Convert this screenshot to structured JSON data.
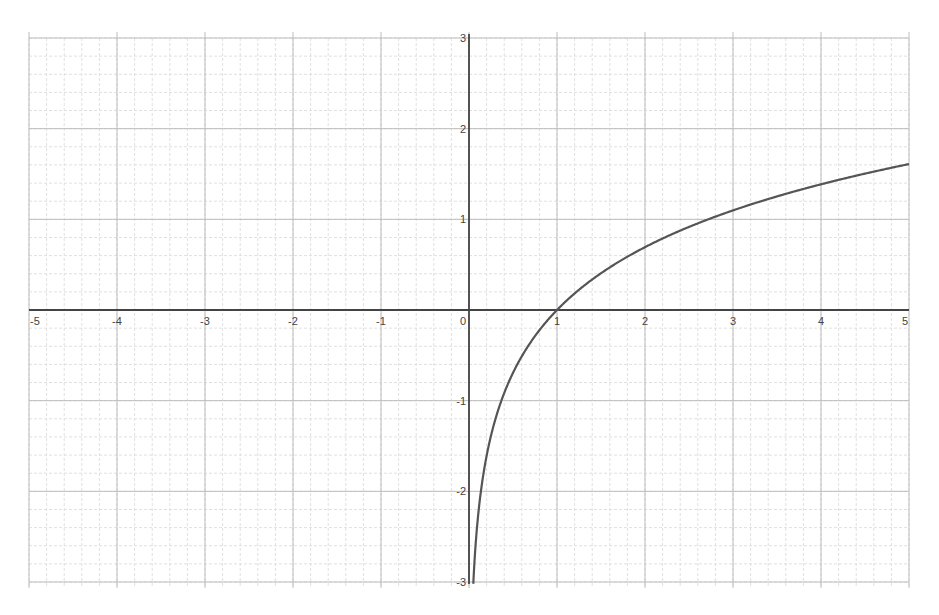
{
  "chart_data": {
    "type": "line",
    "title": "",
    "xlabel": "",
    "ylabel": "",
    "function": "y = ln(x)",
    "xlim": [
      -5,
      5
    ],
    "ylim": [
      -3,
      3
    ],
    "grid": true,
    "minor_grid_subdivisions": 5,
    "x_ticks": [
      "-5",
      "-4",
      "-3",
      "-2",
      "-1",
      "0",
      "1",
      "2",
      "3",
      "4",
      "5"
    ],
    "y_ticks": [
      "3",
      "2",
      "1",
      "-1",
      "-2",
      "-3"
    ],
    "series": [
      {
        "name": "ln(x)",
        "color": "#555555",
        "x": [
          0.05,
          0.1,
          0.2,
          0.3,
          0.5,
          0.75,
          1,
          1.5,
          2,
          2.5,
          3,
          3.5,
          4,
          4.5,
          5
        ],
        "values": [
          -3.0,
          -2.3,
          -1.61,
          -1.2,
          -0.69,
          -0.29,
          0,
          0.41,
          0.69,
          0.92,
          1.1,
          1.25,
          1.39,
          1.5,
          1.61
        ]
      }
    ]
  },
  "style": {
    "axis_color": "#444444",
    "major_grid_color": "#bdbdbd",
    "minor_grid_color": "#e0e0e0",
    "curve_color": "#555555"
  }
}
